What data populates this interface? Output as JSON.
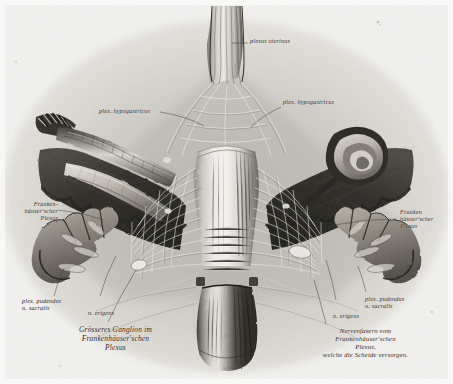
{
  "plate": {
    "title": "Frankenhäuser'scher Plexus — Nerven des Uterus und der Scheide",
    "medium": "engraving",
    "paper_color": "#f4f3f1",
    "ink_color": "#2a2723",
    "width": 453,
    "height": 384
  },
  "labels": {
    "plexus_uterinus": "plexus uterinus",
    "plex_hypogastricus_left": "plex. hypogastricus",
    "plex_hypogastricus_right": "plex. hypogastricus",
    "frankenhauser_left": "Franken-\nhäuser'scher\nPlexus",
    "frankenhauser_left_l1": "Franken-",
    "frankenhauser_left_l2": "häuser'scher",
    "frankenhauser_left_l3": "Plexus",
    "frankenhauser_right_l1": "Franken",
    "frankenhauser_right_l2": "häuser'scher",
    "frankenhauser_right_l3": "Plexus",
    "plex_pudendus_left_l1": "plex. pudendus",
    "plex_pudendus_left_l2": "u. sacralis",
    "plex_pudendus_right_l1": "plex. pudendus",
    "plex_pudendus_right_l2": "u. sacralis",
    "n_erigens_left": "n. erigens",
    "n_erigens_right": "n. erigens",
    "caption_left_l1": "Grösseres Ganglion im",
    "caption_left_l2": "Frankenhäuser'schen",
    "caption_left_l3": "Plexus",
    "caption_right_l1": "Nervenfasern vom",
    "caption_right_l2": "Frankenhäuser'schen",
    "caption_right_l3": "Plexus,",
    "caption_right_l4": "welche die Scheide versorgen."
  },
  "structures": {
    "uterus": "uterus-body",
    "cervix": "cervix-uteri",
    "vagina": "vagina",
    "tube_left": "fallopian-tube-left",
    "fimbriae_left": "fimbriae-left",
    "ovary_left": "ovary-left",
    "tube_right": "fallopian-tube-right",
    "broad_ligament_left": "broad-ligament-left",
    "broad_ligament_right": "broad-ligament-right",
    "sacral_roots_left": "sacral-nerve-roots-left",
    "sacral_roots_right": "sacral-nerve-roots-right",
    "nerve_trunk": "presacral-nerve-trunk"
  }
}
